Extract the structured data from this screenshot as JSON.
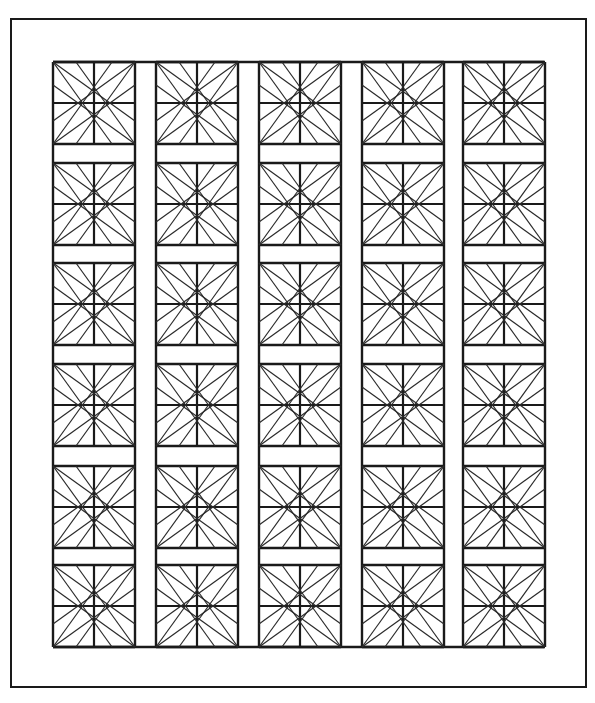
{
  "figure": {
    "colors": {
      "background": "#ffffff",
      "stroke": "#1a1a1a"
    },
    "outer_frame": {
      "x": 11,
      "y": 19,
      "width": 575,
      "height": 668
    },
    "grid_bounds": {
      "x": 53,
      "y": 62,
      "width": 491,
      "height": 585
    },
    "columns": 5,
    "rows": 6,
    "column_x": [
      53,
      156,
      259,
      362,
      463
    ],
    "row_y": [
      62,
      163,
      263,
      364,
      466,
      565
    ],
    "block_width": 82,
    "block_height": 82,
    "star_ratio": 0.72
  }
}
